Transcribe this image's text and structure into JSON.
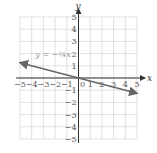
{
  "chart_data": {
    "type": "line",
    "title": "",
    "xlabel": "x",
    "ylabel": "y",
    "xlim": [
      -5,
      5
    ],
    "ylim": [
      -5,
      5
    ],
    "grid": true,
    "x_ticks": [
      -5,
      -4,
      -3,
      -2,
      -1,
      0,
      1,
      2,
      3,
      4,
      5
    ],
    "y_ticks": [
      -5,
      -4,
      -3,
      -2,
      -1,
      1,
      2,
      3,
      4,
      5
    ],
    "series": [
      {
        "name": "y = -1/4 x",
        "equation": "y = -¼x",
        "slope": -0.25,
        "intercept": 0,
        "x": [
          -5,
          5
        ],
        "y": [
          1.25,
          -1.25
        ],
        "arrows": "both"
      }
    ],
    "annotations": [
      {
        "text": "y = −¼x",
        "x": -3,
        "y": 2
      }
    ]
  },
  "labels": {
    "x_axis": "x",
    "y_axis": "y",
    "equation": "y = −¼x"
  },
  "colors": {
    "grid": "#cccccc",
    "axis": "#333333",
    "line": "#666666",
    "label": "#999999"
  }
}
